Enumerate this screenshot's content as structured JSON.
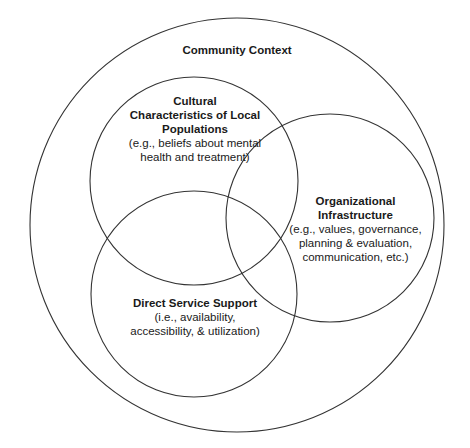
{
  "diagram": {
    "type": "venn",
    "stroke_color": "#333333",
    "background": "#ffffff",
    "outer": {
      "title": "Community Context",
      "cx": 237,
      "cy": 225,
      "r": 207
    },
    "circles": [
      {
        "id": "cultural",
        "title_lines": [
          "Cultural",
          "Characteristics of Local",
          "Populations"
        ],
        "desc_lines": [
          "(e.g., beliefs about mental",
          "health and treatment)"
        ],
        "cx": 194,
        "cy": 181,
        "r": 104
      },
      {
        "id": "organizational",
        "title_lines": [
          "Organizational",
          "Infrastructure"
        ],
        "desc_lines": [
          "(e.g., values, governance,",
          "planning & evaluation,",
          "communication, etc.)"
        ],
        "cx": 330,
        "cy": 218,
        "r": 104
      },
      {
        "id": "direct-service",
        "title_lines": [
          "Direct Service Support"
        ],
        "desc_lines": [
          "(i.e., availability,",
          "accessibility, & utilization)"
        ],
        "cx": 194,
        "cy": 294,
        "r": 103
      }
    ]
  }
}
